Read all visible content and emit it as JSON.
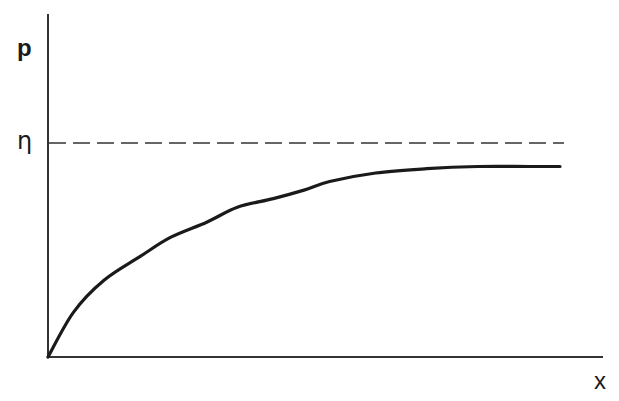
{
  "chart_data": {
    "type": "line",
    "title": "",
    "xlabel": "x",
    "ylabel": "p",
    "grid": false,
    "legend": null,
    "x_ticks": [],
    "y_ticks": [],
    "asymptote": {
      "label": "η",
      "style": "dashed",
      "value": 1.0
    },
    "series": [
      {
        "name": "p(x)",
        "style": "solid",
        "description": "concave saturating curve rising from origin toward η but leveling just below it",
        "x": [
          0,
          0.05,
          0.11,
          0.18,
          0.24,
          0.31,
          0.37,
          0.44,
          0.5,
          0.55,
          0.64,
          0.74,
          0.84,
          0.94,
          1.0
        ],
        "y": [
          0,
          0.21,
          0.36,
          0.47,
          0.56,
          0.63,
          0.7,
          0.74,
          0.78,
          0.82,
          0.86,
          0.88,
          0.89,
          0.89,
          0.89
        ]
      }
    ],
    "xlim": [
      0,
      1.1
    ],
    "ylim": [
      0,
      1.3
    ]
  },
  "labels": {
    "y_axis": "p",
    "x_axis": "x",
    "asymptote": "η"
  },
  "colors": {
    "ink": "#1a1a1a",
    "background": "#ffffff"
  }
}
